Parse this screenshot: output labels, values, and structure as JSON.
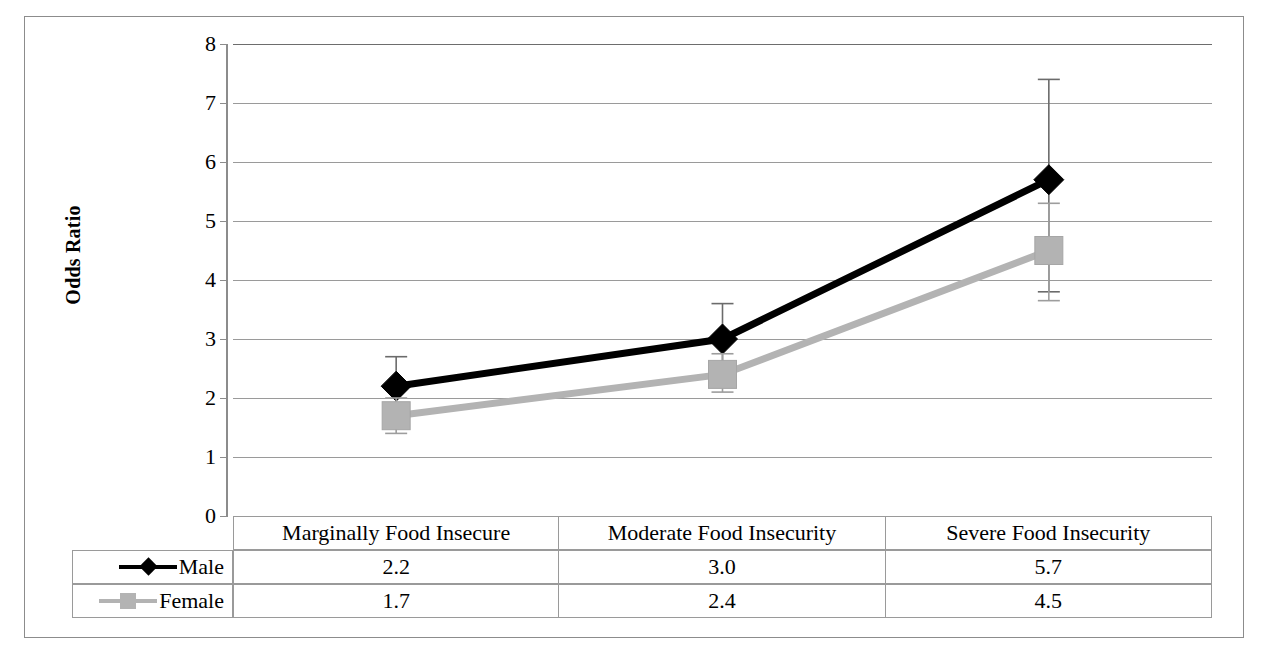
{
  "chart": {
    "type": "line",
    "y_axis_title": "Odds Ratio",
    "y_ticks": [
      "8",
      "7",
      "6",
      "5",
      "4",
      "3",
      "2",
      "1",
      "0"
    ]
  },
  "chart_data": {
    "type": "line",
    "title": "",
    "xlabel": "",
    "ylabel": "Odds Ratio",
    "ylim": [
      0,
      8
    ],
    "grid": true,
    "legend_position": "bottom-table",
    "categories": [
      "Marginally Food Insecure",
      "Moderate Food Insecurity",
      "Severe Food Insecurity"
    ],
    "series": [
      {
        "name": "Male",
        "marker": "diamond",
        "color": "#000000",
        "values": [
          2.2,
          3.0,
          5.7
        ],
        "value_labels": [
          "2.2",
          "3.0",
          "5.7"
        ],
        "error_bars": {
          "lower": [
            1.8,
            2.6,
            3.8
          ],
          "upper": [
            2.7,
            3.6,
            7.4
          ]
        }
      },
      {
        "name": "Female",
        "marker": "square",
        "color": "#b3b3b3",
        "values": [
          1.7,
          2.4,
          4.5
        ],
        "value_labels": [
          "1.7",
          "2.4",
          "4.5"
        ],
        "error_bars": {
          "lower": [
            1.4,
            2.1,
            3.65
          ],
          "upper": [
            2.0,
            2.75,
            5.3
          ]
        }
      }
    ]
  },
  "table": {
    "header_blank": "",
    "headers": [
      "Marginally Food Insecure",
      "Moderate Food Insecurity",
      "Severe Food Insecurity"
    ],
    "rows": [
      {
        "label": "Male",
        "values": [
          "2.2",
          "3.0",
          "5.7"
        ]
      },
      {
        "label": "Female",
        "values": [
          "1.7",
          "2.4",
          "4.5"
        ]
      }
    ]
  },
  "colors": {
    "male": "#000000",
    "female": "#b3b3b3",
    "grid": "#9a9a9a",
    "frame": "#8c8c8c"
  }
}
